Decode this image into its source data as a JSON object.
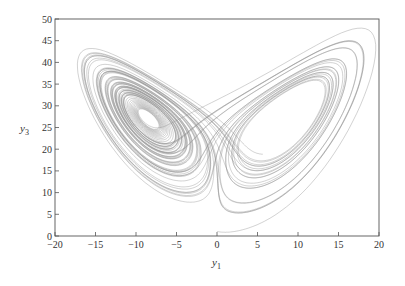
{
  "chart_data": {
    "type": "line",
    "title": "",
    "xlabel": "y1",
    "ylabel": "y3",
    "xlabel_main": "y",
    "xlabel_sub": "1",
    "ylabel_main": "y",
    "ylabel_sub": "3",
    "xlim": [
      -20,
      20
    ],
    "ylim": [
      0,
      50
    ],
    "xticks": [
      -20,
      -15,
      -10,
      -5,
      0,
      5,
      10,
      15,
      20
    ],
    "yticks": [
      0,
      5,
      10,
      15,
      20,
      25,
      30,
      35,
      40,
      45,
      50
    ],
    "grid": false,
    "legend": null,
    "system": {
      "sigma": 10,
      "rho": 28,
      "beta": 2.6667,
      "initial": [
        0,
        1,
        1.05
      ],
      "dt": 0.005,
      "steps": 12000
    },
    "line_color": "#8a8a8a"
  }
}
